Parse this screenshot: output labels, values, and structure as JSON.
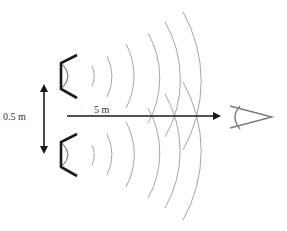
{
  "diagram": {
    "labels": {
      "speaker_separation": "0.5 m",
      "listener_distance": "5 m"
    },
    "elements": {
      "speakers": [
        "upper-speaker",
        "lower-speaker"
      ],
      "listener": "eye",
      "wavefronts_per_speaker": 6
    },
    "colors": {
      "speaker": "#1a1a1a",
      "arrow": "#1a1a1a",
      "wavefront": "#9a9a9a",
      "eye": "#7a7a7a",
      "text": "#333333"
    }
  }
}
